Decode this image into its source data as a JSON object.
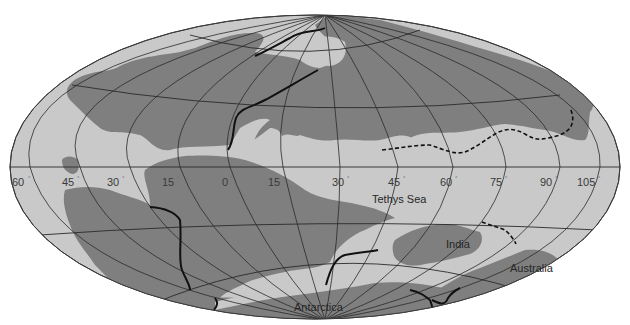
{
  "map": {
    "projection": "elliptical world projection (graticule)",
    "colors": {
      "ocean": "#c9c9c9",
      "land": "#7f7f7f",
      "grid": "#2a2a2a",
      "boundary": "#111111",
      "background": "#ffffff"
    },
    "longitude_labels": [
      {
        "value": "60",
        "unit": "°"
      },
      {
        "value": "45",
        "unit": "°"
      },
      {
        "value": "30",
        "unit": "°"
      },
      {
        "value": "15",
        "unit": "°"
      },
      {
        "value": "0",
        "unit": "°"
      },
      {
        "value": "15",
        "unit": "°"
      },
      {
        "value": "30",
        "unit": "°"
      },
      {
        "value": "45",
        "unit": "°"
      },
      {
        "value": "60",
        "unit": "°"
      },
      {
        "value": "75",
        "unit": "°"
      },
      {
        "value": "90",
        "unit": "°"
      },
      {
        "value": "105",
        "unit": "°"
      }
    ],
    "place_labels": {
      "tethys_sea": "Tethys Sea",
      "india": "India",
      "australia": "Australia",
      "antarctica": "Antarctica"
    }
  }
}
